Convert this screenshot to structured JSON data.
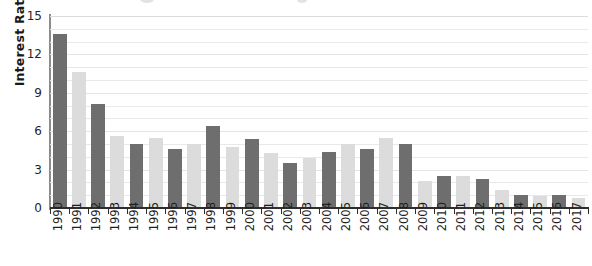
{
  "chart_data": {
    "type": "bar",
    "title": "",
    "xlabel": "",
    "ylabel": "Interest Rate (%)",
    "ylim": [
      0,
      15
    ],
    "ytick_labels": [
      "0",
      "3",
      "6",
      "9",
      "12",
      "15"
    ],
    "ytick_values": [
      0,
      3,
      6,
      9,
      12,
      15
    ],
    "gridlines": true,
    "gridline_interval": 1,
    "legend": "none",
    "categories": [
      "1990",
      "1991",
      "1992",
      "1993",
      "1994",
      "1995",
      "1996",
      "1997",
      "1998",
      "1999",
      "2000",
      "2001",
      "2002",
      "2003",
      "2004",
      "2005",
      "2006",
      "2007",
      "2008",
      "2009",
      "2010",
      "2011",
      "2012",
      "2013",
      "2014",
      "2015",
      "2016",
      "2017"
    ],
    "values": [
      13.6,
      10.6,
      8.1,
      5.6,
      5.0,
      5.5,
      4.6,
      5.0,
      6.4,
      4.8,
      5.4,
      4.3,
      3.5,
      3.9,
      4.4,
      5.0,
      4.6,
      5.5,
      5.0,
      2.1,
      2.5,
      2.5,
      2.3,
      1.4,
      1.0,
      0.9,
      1.0,
      0.8
    ],
    "bar_shades": [
      "dark",
      "light",
      "dark",
      "light",
      "dark",
      "light",
      "dark",
      "light",
      "dark",
      "light",
      "dark",
      "light",
      "dark",
      "light",
      "dark",
      "light",
      "dark",
      "light",
      "dark",
      "light",
      "dark",
      "light",
      "dark",
      "light",
      "dark",
      "light",
      "dark",
      "light"
    ],
    "colors": {
      "bar_dark": "#6e6e6e",
      "bar_light": "#dcdcdc",
      "gridline": "#e9e9e9",
      "axis": "#2e2e2e",
      "y_axis": "#8d8d8d",
      "text": "#1a1a1a"
    }
  }
}
